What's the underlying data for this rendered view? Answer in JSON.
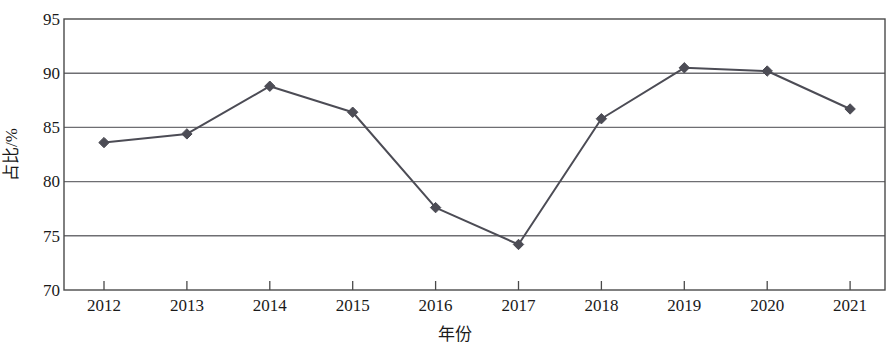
{
  "chart_data": {
    "type": "line",
    "title": "",
    "xlabel": "年份",
    "ylabel": "占比/%",
    "categories": [
      "2012",
      "2013",
      "2014",
      "2015",
      "2016",
      "2017",
      "2018",
      "2019",
      "2020",
      "2021"
    ],
    "values": [
      83.6,
      84.4,
      88.8,
      86.4,
      77.6,
      74.2,
      85.8,
      90.5,
      90.2,
      86.7
    ],
    "ylim": [
      70,
      95
    ],
    "ytick_step": 5,
    "ytick_labels": [
      "70",
      "75",
      "80",
      "85",
      "90",
      "95"
    ],
    "grid": "horizontal",
    "legend": "none",
    "marker": "diamond",
    "series_color": "#4c4c55",
    "grid_color": "#6e6e72",
    "axis_color": "#4a4a4a",
    "text_color": "#1a1a1a"
  }
}
